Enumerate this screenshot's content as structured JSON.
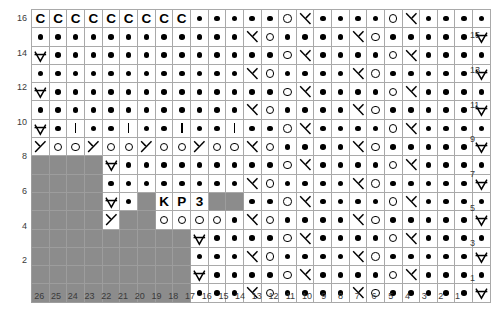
{
  "chart": {
    "rows": 16,
    "cols": 26,
    "colors": {
      "background": "#ffffff",
      "grid_line": "#a9a9a9",
      "no_stitch": "#8c8c8c",
      "symbol": "#000000",
      "axis_text": "#3a3a3a"
    },
    "legend_symbol_names": {
      "dot": "purl",
      "yo": "yarn-over",
      "bar": "knit",
      "k2tog": "right-leaning-decrease",
      "ssk": "left-leaning-decrease",
      "cdd": "centered-double-decrease",
      "C": "cast-off",
      "K": "K",
      "P": "P",
      "3": "3",
      "none": "no-stitch"
    },
    "row_labels_left": [
      "16",
      "",
      "14",
      "",
      "12",
      "",
      "10",
      "",
      "8",
      "",
      "6",
      "",
      "4",
      "",
      "2",
      ""
    ],
    "row_labels_right": [
      "",
      "15",
      "",
      "13",
      "",
      "11",
      "",
      "9",
      "",
      "7",
      "",
      "5",
      "",
      "3",
      "",
      "1"
    ],
    "column_labels": [
      "26",
      "25",
      "24",
      "23",
      "22",
      "21",
      "20",
      "19",
      "18",
      "17",
      "16",
      "15",
      "14",
      "13",
      "12",
      "11",
      "10",
      "9",
      "8",
      "7",
      "6",
      "5",
      "4",
      "3",
      "2",
      "1"
    ],
    "grid": [
      [
        "C",
        "C",
        "C",
        "C",
        "C",
        "C",
        "C",
        "C",
        "C",
        "dot",
        "dot",
        "dot",
        "dot",
        "dot",
        "yo",
        "k2tog",
        "dot",
        "dot",
        "dot",
        "dot",
        "yo",
        "k2tog",
        "dot",
        "dot",
        "dot",
        "dot"
      ],
      [
        "dot",
        "dot",
        "dot",
        "dot",
        "dot",
        "dot",
        "dot",
        "dot",
        "dot",
        "dot",
        "dot",
        "dot",
        "k2tog",
        "yo",
        "dot",
        "dot",
        "dot",
        "dot",
        "k2tog",
        "yo",
        "dot",
        "dot",
        "dot",
        "dot",
        "dot",
        "cdd"
      ],
      [
        "cdd",
        "dot",
        "dot",
        "dot",
        "dot",
        "dot",
        "dot",
        "dot",
        "dot",
        "dot",
        "dot",
        "dot",
        "dot",
        "dot",
        "yo",
        "k2tog",
        "dot",
        "dot",
        "dot",
        "dot",
        "yo",
        "k2tog",
        "dot",
        "dot",
        "dot",
        "dot"
      ],
      [
        "dot",
        "dot",
        "dot",
        "dot",
        "dot",
        "dot",
        "dot",
        "dot",
        "dot",
        "dot",
        "dot",
        "dot",
        "k2tog",
        "yo",
        "dot",
        "dot",
        "dot",
        "dot",
        "k2tog",
        "yo",
        "dot",
        "dot",
        "dot",
        "dot",
        "dot",
        "cdd"
      ],
      [
        "cdd",
        "dot",
        "dot",
        "dot",
        "dot",
        "dot",
        "dot",
        "dot",
        "dot",
        "dot",
        "dot",
        "dot",
        "dot",
        "dot",
        "yo",
        "k2tog",
        "dot",
        "dot",
        "dot",
        "dot",
        "yo",
        "k2tog",
        "dot",
        "dot",
        "dot",
        "dot"
      ],
      [
        "dot",
        "dot",
        "dot",
        "dot",
        "dot",
        "dot",
        "dot",
        "dot",
        "dot",
        "dot",
        "dot",
        "dot",
        "k2tog",
        "yo",
        "dot",
        "dot",
        "dot",
        "dot",
        "k2tog",
        "yo",
        "dot",
        "dot",
        "dot",
        "dot",
        "dot",
        "cdd"
      ],
      [
        "cdd",
        "dot",
        "bar",
        "dot",
        "dot",
        "bar",
        "dot",
        "dot",
        "bar",
        "dot",
        "dot",
        "bar",
        "dot",
        "dot",
        "yo",
        "k2tog",
        "dot",
        "dot",
        "dot",
        "dot",
        "yo",
        "k2tog",
        "dot",
        "dot",
        "dot",
        "dot"
      ],
      [
        "ssk",
        "yo",
        "yo",
        "ssk",
        "yo",
        "yo",
        "ssk",
        "yo",
        "yo",
        "ssk",
        "yo",
        "yo",
        "k2tog",
        "yo",
        "dot",
        "dot",
        "dot",
        "dot",
        "k2tog",
        "yo",
        "dot",
        "dot",
        "dot",
        "dot",
        "dot",
        "cdd"
      ],
      [
        "none",
        "none",
        "none",
        "none",
        "cdd",
        "dot",
        "dot",
        "dot",
        "dot",
        "dot",
        "dot",
        "dot",
        "dot",
        "dot",
        "yo",
        "k2tog",
        "dot",
        "dot",
        "dot",
        "dot",
        "yo",
        "k2tog",
        "dot",
        "dot",
        "dot",
        "dot"
      ],
      [
        "none",
        "none",
        "none",
        "none",
        "dot",
        "dot",
        "dot",
        "dot",
        "dot",
        "dot",
        "dot",
        "dot",
        "k2tog",
        "yo",
        "dot",
        "dot",
        "dot",
        "dot",
        "k2tog",
        "yo",
        "dot",
        "dot",
        "dot",
        "dot",
        "dot",
        "cdd"
      ],
      [
        "none",
        "none",
        "none",
        "none",
        "cdd",
        "dot",
        "none",
        "K",
        "P",
        "3",
        "none",
        "none",
        "dot",
        "dot",
        "yo",
        "k2tog",
        "dot",
        "dot",
        "dot",
        "dot",
        "yo",
        "k2tog",
        "dot",
        "dot",
        "dot",
        "dot"
      ],
      [
        "none",
        "none",
        "none",
        "none",
        "ssk",
        "none",
        "none",
        "yo",
        "yo",
        "yo",
        "yo",
        "dot",
        "k2tog",
        "yo",
        "dot",
        "dot",
        "dot",
        "dot",
        "k2tog",
        "yo",
        "dot",
        "dot",
        "dot",
        "dot",
        "dot",
        "cdd"
      ],
      [
        "none",
        "none",
        "none",
        "none",
        "none",
        "none",
        "none",
        "none",
        "none",
        "cdd",
        "dot",
        "dot",
        "dot",
        "dot",
        "yo",
        "k2tog",
        "dot",
        "dot",
        "dot",
        "dot",
        "yo",
        "k2tog",
        "dot",
        "dot",
        "dot",
        "dot"
      ],
      [
        "none",
        "none",
        "none",
        "none",
        "none",
        "none",
        "none",
        "none",
        "none",
        "dot",
        "dot",
        "dot",
        "k2tog",
        "yo",
        "dot",
        "dot",
        "dot",
        "dot",
        "k2tog",
        "yo",
        "dot",
        "dot",
        "dot",
        "dot",
        "dot",
        "cdd"
      ],
      [
        "none",
        "none",
        "none",
        "none",
        "none",
        "none",
        "none",
        "none",
        "none",
        "cdd",
        "dot",
        "dot",
        "dot",
        "dot",
        "yo",
        "k2tog",
        "dot",
        "dot",
        "dot",
        "dot",
        "yo",
        "k2tog",
        "dot",
        "dot",
        "dot",
        "dot"
      ],
      [
        "none",
        "none",
        "none",
        "none",
        "none",
        "none",
        "none",
        "none",
        "none",
        "dot",
        "dot",
        "dot",
        "k2tog",
        "yo",
        "dot",
        "dot",
        "dot",
        "dot",
        "k2tog",
        "yo",
        "dot",
        "dot",
        "dot",
        "dot",
        "dot",
        "cdd"
      ]
    ]
  }
}
